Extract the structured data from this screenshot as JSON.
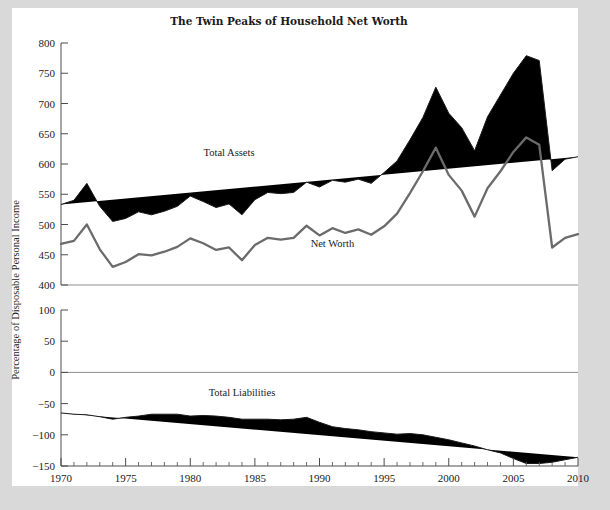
{
  "page": {
    "background_color": "#d9d9d9",
    "paper_color": "#ffffff"
  },
  "chart_data": {
    "type": "line",
    "title": "The Twin Peaks of Household Net Worth",
    "xlabel": "",
    "ylabel": "Percentage of Disposable Personal Income",
    "grid": false,
    "legend_position": "inline-annotations",
    "panels": [
      {
        "name": "upper",
        "ylim": [
          400,
          800
        ],
        "yticks": [
          400,
          450,
          500,
          550,
          600,
          650,
          700,
          750,
          800
        ],
        "ytick_labels": [
          "400",
          "450",
          "500",
          "550",
          "600",
          "650",
          "700",
          "750",
          "800"
        ],
        "baseline": 400,
        "series": [
          {
            "name": "Total Assets",
            "color": "#1a1a1a",
            "label_x": 1983,
            "label_y": 613,
            "values": [
              533,
              540,
              568,
              530,
              505,
              510,
              521,
              516,
              522,
              530,
              547,
              538,
              528,
              534,
              516,
              541,
              553,
              551,
              553,
              570,
              562,
              573,
              570,
              575,
              568,
              586,
              605,
              640,
              677,
              727,
              684,
              660,
              622,
              678,
              714,
              750,
              779,
              771,
              589,
              608,
              612
            ]
          },
          {
            "name": "Net Worth",
            "color": "#6b6b6b",
            "label_x": 1991,
            "label_y": 463,
            "values": [
              468,
              473,
              500,
              459,
              430,
              438,
              451,
              449,
              455,
              463,
              477,
              469,
              458,
              462,
              441,
              466,
              478,
              475,
              478,
              498,
              482,
              494,
              486,
              492,
              483,
              497,
              518,
              552,
              588,
              627,
              582,
              556,
              513,
              560,
              588,
              620,
              644,
              632,
              462,
              478,
              484
            ]
          }
        ]
      },
      {
        "name": "lower",
        "ylim": [
          -150,
          100
        ],
        "yticks": [
          -150,
          -100,
          -50,
          0,
          50,
          100
        ],
        "ytick_labels": [
          "−150",
          "−100",
          "−50",
          "0",
          "50",
          "100"
        ],
        "baseline": 0,
        "series": [
          {
            "name": "Total Liabilities",
            "color": "#1a1a1a",
            "label_x": 1984,
            "label_y": -38,
            "values": [
              -65,
              -67,
              -68,
              -71,
              -75,
              -72,
              -70,
              -67,
              -67,
              -67,
              -70,
              -69,
              -70,
              -72,
              -75,
              -75,
              -75,
              -76,
              -75,
              -72,
              -80,
              -87,
              -90,
              -92,
              -95,
              -97,
              -99,
              -98,
              -100,
              -104,
              -108,
              -113,
              -118,
              -124,
              -129,
              -138,
              -146,
              -146,
              -144,
              -140,
              -136
            ]
          }
        ]
      }
    ],
    "x": [
      1970,
      1971,
      1972,
      1973,
      1974,
      1975,
      1976,
      1977,
      1978,
      1979,
      1980,
      1981,
      1982,
      1983,
      1984,
      1985,
      1986,
      1987,
      1988,
      1989,
      1990,
      1991,
      1992,
      1993,
      1994,
      1995,
      1996,
      1997,
      1998,
      1999,
      2000,
      2001,
      2002,
      2003,
      2004,
      2005,
      2006,
      2007,
      2008,
      2009,
      2010
    ],
    "xlim": [
      1970,
      2010
    ],
    "xticks": [
      1970,
      1975,
      1980,
      1985,
      1990,
      1995,
      2000,
      2005,
      2010
    ],
    "xtick_labels": [
      "1970",
      "1975",
      "1980",
      "1985",
      "1990",
      "1995",
      "2000",
      "2005",
      "2010"
    ],
    "xtick_minor_step": 1
  }
}
